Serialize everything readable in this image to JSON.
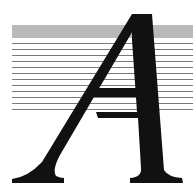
{
  "illustration": {
    "letter": "A",
    "style": "italic serif drop cap over horizontal rules",
    "colors": {
      "background": "#ffffff",
      "band": "#b9b9b9",
      "rules": "#7a7a7a",
      "letter": "#111111"
    },
    "rule_count": 12
  }
}
